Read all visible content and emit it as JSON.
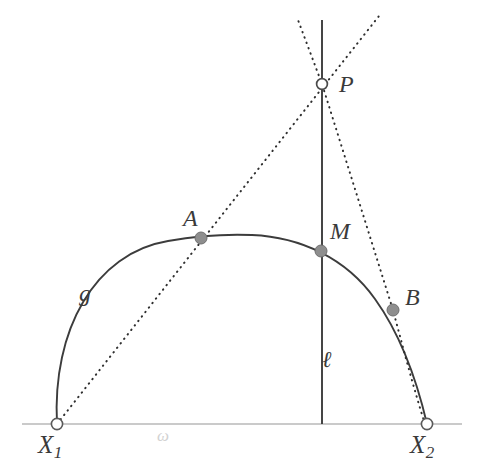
{
  "figure": {
    "type": "geometry-diagram",
    "background_color": "#ffffff",
    "colors": {
      "curve": "#3c3c3c",
      "line": "#3c3c3c",
      "baseline": "#b9b9b9",
      "dotted": "#2e2e2e",
      "point_fill": "#8e8e8e",
      "point_stroke": "#6f6f6f",
      "open_point_fill": "#ffffff",
      "open_point_stroke": "#5a5a5a",
      "label": "#3a3a3a",
      "baseline_label": "#d2d2d2"
    },
    "labels": {
      "arc": "g",
      "vertical_line": "ℓ",
      "baseline": "ω",
      "apex_point": "P",
      "left_point": "A",
      "mid_point": "M",
      "right_point": "B",
      "left_endpoint_base": "X",
      "left_endpoint_sub": "1",
      "right_endpoint_base": "X",
      "right_endpoint_sub": "2"
    },
    "points": {
      "P": {
        "x": 322,
        "y": 84,
        "style": "open"
      },
      "A": {
        "x": 201,
        "y": 238,
        "style": "filled"
      },
      "M": {
        "x": 321,
        "y": 251,
        "style": "filled"
      },
      "B": {
        "x": 393,
        "y": 310,
        "style": "filled"
      },
      "X1": {
        "x": 57,
        "y": 424,
        "style": "open"
      },
      "X2": {
        "x": 427,
        "y": 424,
        "style": "open"
      }
    },
    "geometry": {
      "baseline_y": 424,
      "baseline_x_start": 22,
      "baseline_x_end": 462,
      "vertical_line_x": 322,
      "vertical_line_y_top": 20,
      "vertical_line_y_bottom": 424,
      "arc_apex_x": 252,
      "arc_apex_y": 235,
      "dotted_left_top_x": 298,
      "dotted_left_top_y": 20,
      "dotted_right_top_x": 379,
      "dotted_right_top_y": 16
    }
  }
}
